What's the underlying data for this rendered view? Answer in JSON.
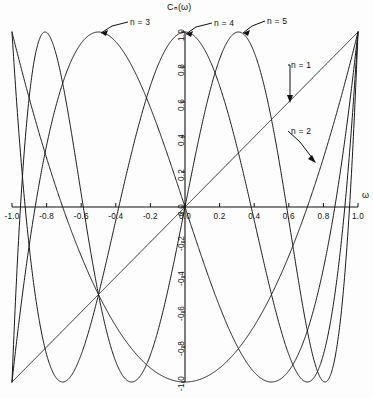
{
  "chart_data": {
    "type": "line",
    "title": "",
    "ylabel": "Cₙ(ω)",
    "xlabel": "ω",
    "xlim": [
      -1.0,
      1.0
    ],
    "ylim": [
      -1.0,
      1.0
    ],
    "grid": false,
    "legend_position": "inline-annotations",
    "xticks": [
      "-1.0",
      "-0.8",
      "-0.6",
      "-0.4",
      "-0.2",
      "0.0",
      "0.2",
      "0.4",
      "0.6",
      "0.8",
      "1.0"
    ],
    "xtick_values": [
      -1.0,
      -0.8,
      -0.6,
      -0.4,
      -0.2,
      0.0,
      0.2,
      0.4,
      0.6,
      0.8,
      1.0
    ],
    "yticks": [
      "-1.0",
      "-0.8",
      "-0.6",
      "-0.4",
      "-0.2",
      "0.0",
      "0.2",
      "0.4",
      "0.6",
      "0.8",
      "1.0"
    ],
    "ytick_values": [
      -1.0,
      -0.8,
      -0.6,
      -0.4,
      -0.2,
      0.0,
      0.2,
      0.4,
      0.6,
      0.8,
      1.0
    ],
    "series": [
      {
        "name": "n = 1",
        "n": 1,
        "formula": "cos(1*arccos(w))",
        "label": "n = 1",
        "x": [
          -1.0,
          -0.8,
          -0.6,
          -0.4,
          -0.2,
          0.0,
          0.2,
          0.4,
          0.6,
          0.8,
          1.0
        ],
        "values": [
          -1.0,
          -0.8,
          -0.6,
          -0.4,
          -0.2,
          0.0,
          0.2,
          0.4,
          0.6,
          0.8,
          1.0
        ]
      },
      {
        "name": "n = 2",
        "n": 2,
        "formula": "cos(2*arccos(w))",
        "label": "n = 2",
        "x": [
          -1.0,
          -0.8,
          -0.6,
          -0.4,
          -0.2,
          0.0,
          0.2,
          0.4,
          0.6,
          0.8,
          1.0
        ],
        "values": [
          1.0,
          0.28,
          -0.28,
          -0.68,
          -0.92,
          -1.0,
          -0.92,
          -0.68,
          -0.28,
          0.28,
          1.0
        ]
      },
      {
        "name": "n = 3",
        "n": 3,
        "formula": "cos(3*arccos(w))",
        "label": "n = 3",
        "x": [
          -1.0,
          -0.8,
          -0.6,
          -0.4,
          -0.2,
          0.0,
          0.2,
          0.4,
          0.6,
          0.8,
          1.0
        ],
        "values": [
          -1.0,
          0.352,
          0.936,
          0.608,
          -0.008,
          0.0,
          0.008,
          -0.608,
          -0.936,
          -0.352,
          1.0
        ]
      },
      {
        "name": "n = 4",
        "n": 4,
        "formula": "cos(4*arccos(w))",
        "label": "n = 4",
        "x": [
          -1.0,
          -0.8,
          -0.6,
          -0.4,
          -0.2,
          0.0,
          0.2,
          0.4,
          0.6,
          0.8,
          1.0
        ],
        "values": [
          1.0,
          -0.843,
          -0.843,
          0.075,
          0.693,
          1.0,
          0.693,
          0.075,
          -0.843,
          -0.843,
          1.0
        ]
      },
      {
        "name": "n = 5",
        "n": 5,
        "formula": "cos(5*arccos(w))",
        "label": "n = 5",
        "x": [
          -1.0,
          -0.8,
          -0.6,
          -0.4,
          -0.2,
          0.0,
          0.2,
          0.4,
          0.6,
          0.8,
          1.0
        ],
        "values": [
          -1.0,
          0.998,
          -0.338,
          -0.931,
          0.397,
          0.0,
          -0.397,
          0.931,
          0.338,
          -0.998,
          1.0
        ]
      }
    ],
    "annotations": [
      {
        "label": "n = 3",
        "points_to_n": 3
      },
      {
        "label": "n = 4",
        "points_to_n": 4
      },
      {
        "label": "n = 5",
        "points_to_n": 5
      },
      {
        "label": "n = 1",
        "points_to_n": 1
      },
      {
        "label": "n = 2",
        "points_to_n": 2
      }
    ],
    "colors": {
      "curve": "#1a1a1a",
      "axis": "#111111",
      "background": "#fdfdfd"
    }
  },
  "axes": {
    "y_axis_title": "Cₙ(ω)",
    "x_axis_title": "ω"
  },
  "annotations": {
    "n1": "n = 1",
    "n2": "n = 2",
    "n3": "n = 3",
    "n4": "n = 4",
    "n5": "n = 5"
  }
}
